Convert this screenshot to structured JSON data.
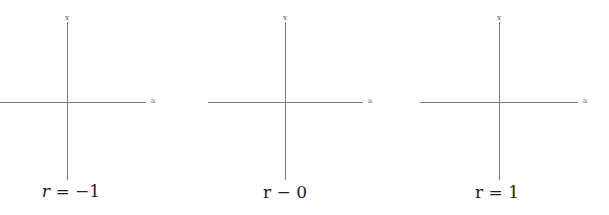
{
  "panels": [
    {
      "x_axis_label": "x",
      "a_axis_label": "a",
      "caption_var": "r",
      "caption_rest": " = −1"
    },
    {
      "x_axis_label": "x",
      "a_axis_label": "a",
      "caption_var": "r",
      "caption_rest": " − 0"
    },
    {
      "x_axis_label": "x",
      "a_axis_label": "a",
      "caption_var": "r",
      "caption_rest": " = 1"
    }
  ]
}
